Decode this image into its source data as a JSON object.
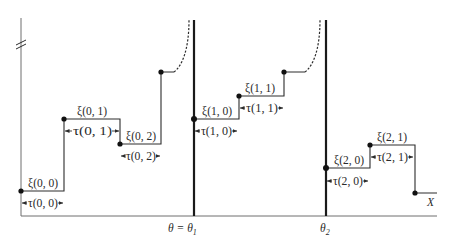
{
  "diagram": {
    "type": "step-process",
    "axes": {
      "x_label": "X",
      "y_break": true
    },
    "thresholds": [
      {
        "id": "theta1",
        "label": "θ = θ",
        "subscript": "1",
        "x": 194
      },
      {
        "id": "theta2",
        "label": "θ",
        "subscript": "2",
        "x": 326
      }
    ],
    "states": [
      {
        "id": "xi00",
        "label": "ξ(0, 0)"
      },
      {
        "id": "xi01",
        "label": "ξ(0, 1)"
      },
      {
        "id": "xi02",
        "label": "ξ(0, 2)"
      },
      {
        "id": "xi10",
        "label": "ξ(1, 0)"
      },
      {
        "id": "xi11",
        "label": "ξ(1, 1)"
      },
      {
        "id": "xi20",
        "label": "ξ(2, 0)"
      },
      {
        "id": "xi21",
        "label": "ξ(2, 1)"
      }
    ],
    "durations": [
      {
        "id": "tau00",
        "label": "τ(0, 0)"
      },
      {
        "id": "tau01",
        "label": "τ(0, 1)"
      },
      {
        "id": "tau02",
        "label": "τ(0, 2)"
      },
      {
        "id": "tau10",
        "label": "τ(1, 0)"
      },
      {
        "id": "tau11",
        "label": "τ(1, 1)"
      },
      {
        "id": "tau20",
        "label": "τ(2, 0)"
      },
      {
        "id": "tau21",
        "label": "τ(2, 1)"
      }
    ]
  }
}
